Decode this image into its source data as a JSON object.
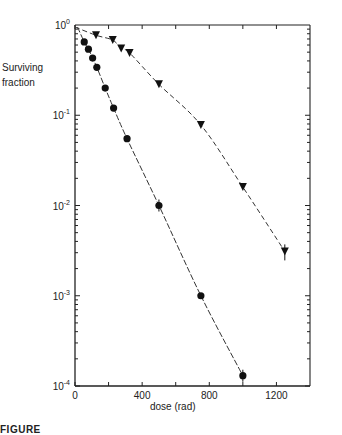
{
  "figure": {
    "ylabel_line1": "Surviving",
    "ylabel_line2": "fraction",
    "xlabel": "dose (rad)",
    "caption": "FIGURE"
  },
  "chart_data": {
    "type": "scatter",
    "title": "",
    "xlabel": "dose (rad)",
    "ylabel": "Surviving fraction",
    "xscale": "linear",
    "yscale": "log",
    "xlim": [
      0,
      1400
    ],
    "ylim": [
      0.0001,
      1
    ],
    "x_ticks": [
      0,
      400,
      800,
      1200
    ],
    "x_minor_ticks": [
      200,
      600,
      1000
    ],
    "y_ticks": [
      {
        "value": 1,
        "label": "10^0"
      },
      {
        "value": 0.1,
        "label": "10^-1"
      },
      {
        "value": 0.01,
        "label": "10^-2"
      },
      {
        "value": 0.001,
        "label": "10^-3"
      },
      {
        "value": 0.0001,
        "label": "10^-4"
      }
    ],
    "grid": false,
    "legend": "none",
    "series": [
      {
        "name": "circles",
        "marker": "circle",
        "line": "solid",
        "x": [
          55,
          80,
          105,
          130,
          180,
          230,
          310,
          500,
          750,
          1000
        ],
        "values": [
          0.65,
          0.54,
          0.43,
          0.34,
          0.2,
          0.12,
          0.055,
          0.01,
          0.001,
          0.00013
        ]
      },
      {
        "name": "triangles",
        "marker": "triangle-down",
        "line": "dashed-to-solid",
        "x": [
          125,
          225,
          275,
          325,
          500,
          750,
          1000,
          1250
        ],
        "values": [
          0.77,
          0.68,
          0.55,
          0.49,
          0.22,
          0.078,
          0.016,
          0.0031
        ]
      }
    ]
  }
}
